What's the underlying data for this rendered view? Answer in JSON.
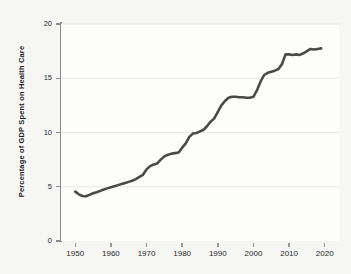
{
  "chart_data": {
    "type": "line",
    "title": "",
    "xlabel": "",
    "ylabel": "Percentage of GDP Spent on Health Care",
    "xlim": [
      1946,
      2024
    ],
    "ylim": [
      0,
      20
    ],
    "grid": true,
    "legend": null,
    "xticks": [
      1950,
      1960,
      1970,
      1980,
      1990,
      2000,
      2010,
      2020
    ],
    "xtick_labels": [
      "1950",
      "1960",
      "1970",
      "1980",
      "1990",
      "2000",
      "2010",
      "2020"
    ],
    "yticks": [
      0,
      5,
      10,
      15,
      20
    ],
    "ytick_labels": [
      "0",
      "5",
      "10",
      "15",
      "20"
    ],
    "line_color": "#4a4a4a",
    "line_width": 2.6,
    "series": [
      {
        "name": "Percentage of GDP Spent on Health Care",
        "x": [
          1950,
          1951,
          1952,
          1953,
          1954,
          1955,
          1956,
          1957,
          1958,
          1959,
          1960,
          1961,
          1962,
          1963,
          1964,
          1965,
          1966,
          1967,
          1968,
          1969,
          1970,
          1971,
          1972,
          1973,
          1974,
          1975,
          1976,
          1977,
          1978,
          1979,
          1980,
          1981,
          1982,
          1983,
          1984,
          1985,
          1986,
          1987,
          1988,
          1989,
          1990,
          1991,
          1992,
          1993,
          1994,
          1995,
          1996,
          1997,
          1998,
          1999,
          2000,
          2001,
          2002,
          2003,
          2004,
          2005,
          2006,
          2007,
          2008,
          2009,
          2010,
          2011,
          2012,
          2013,
          2014,
          2015,
          2016,
          2017,
          2018,
          2019
        ],
        "y": [
          4.55,
          4.3,
          4.15,
          4.12,
          4.25,
          4.4,
          4.5,
          4.62,
          4.75,
          4.85,
          4.95,
          5.05,
          5.15,
          5.25,
          5.35,
          5.45,
          5.55,
          5.7,
          5.9,
          6.1,
          6.6,
          6.9,
          7.05,
          7.15,
          7.5,
          7.8,
          7.95,
          8.05,
          8.1,
          8.15,
          8.6,
          9.0,
          9.6,
          9.9,
          9.95,
          10.1,
          10.25,
          10.6,
          11.0,
          11.3,
          11.9,
          12.5,
          12.9,
          13.2,
          13.3,
          13.3,
          13.25,
          13.25,
          13.2,
          13.2,
          13.3,
          13.9,
          14.7,
          15.3,
          15.5,
          15.6,
          15.7,
          15.85,
          16.3,
          17.2,
          17.2,
          17.15,
          17.2,
          17.15,
          17.3,
          17.5,
          17.7,
          17.65,
          17.7,
          17.75
        ]
      }
    ]
  }
}
